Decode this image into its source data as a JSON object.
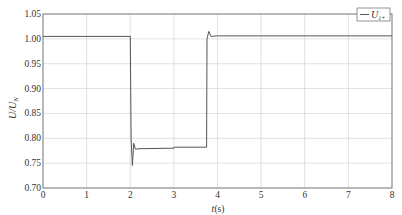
{
  "chart_data": {
    "type": "line",
    "title": "",
    "xlabel": "t(s)",
    "ylabel": "U/U_N",
    "xlim": [
      0,
      8
    ],
    "ylim": [
      0.7,
      1.05
    ],
    "xticks": [
      "0",
      "1",
      "2",
      "3",
      "4",
      "5",
      "6",
      "7",
      "8"
    ],
    "yticks": [
      "0.70",
      "0.75",
      "0.80",
      "0.85",
      "0.90",
      "0.95",
      "1.00",
      "1.05"
    ],
    "grid": true,
    "legend": {
      "position": "upper right",
      "entries": [
        "U_1+"
      ]
    },
    "series": [
      {
        "name": "U_1+",
        "x": [
          0,
          2.0,
          2.02,
          2.05,
          2.08,
          2.12,
          2.2,
          3.0,
          3.0,
          3.75,
          3.76,
          3.8,
          3.85,
          4.0,
          8.0
        ],
        "y": [
          1.005,
          1.005,
          0.8,
          0.745,
          0.79,
          0.778,
          0.779,
          0.78,
          0.782,
          0.782,
          1.0,
          1.015,
          1.005,
          1.006,
          1.006
        ]
      }
    ]
  },
  "axes": {
    "xlabel_t": "t",
    "xlabel_unit": "(s)",
    "ylabel_main": "U/U",
    "ylabel_sub": "N"
  },
  "legend": {
    "label_main": "U",
    "label_sub": "1+"
  }
}
